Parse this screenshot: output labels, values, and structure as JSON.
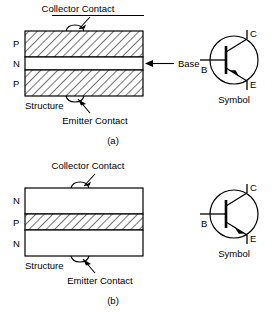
{
  "figure": {
    "title_implicit": "Bipolar junction transistor structures and symbols",
    "colors": {
      "ink": "#000000",
      "background": "#ffffff",
      "hatch": "#000000"
    }
  },
  "panels": [
    {
      "id": "a",
      "caption": "(a)",
      "device_type": "PNP",
      "structure": {
        "label": "Structure",
        "layers": [
          {
            "name": "P",
            "fill": "hatched",
            "role": "collector"
          },
          {
            "name": "N",
            "fill": "white",
            "role": "base"
          },
          {
            "name": "P",
            "fill": "hatched",
            "role": "emitter"
          }
        ],
        "annotations": [
          {
            "name": "collector-contact",
            "text": "Collector Contact",
            "underlined": true,
            "position": "top"
          },
          {
            "name": "emitter-contact",
            "text": "Emitter Contact",
            "underlined": false,
            "position": "bottom"
          },
          {
            "name": "base-callout",
            "text": "Base",
            "position": "right"
          }
        ]
      },
      "symbol": {
        "label": "Symbol",
        "terminals": [
          {
            "name": "base",
            "letter": "B"
          },
          {
            "name": "collector",
            "letter": "C"
          },
          {
            "name": "emitter",
            "letter": "E"
          }
        ],
        "arrow_direction": "in",
        "arrow_on": "emitter"
      }
    },
    {
      "id": "b",
      "caption": "(b)",
      "device_type": "NPN",
      "structure": {
        "label": "Structure",
        "layers": [
          {
            "name": "N",
            "fill": "white",
            "role": "collector"
          },
          {
            "name": "P",
            "fill": "hatched",
            "role": "base"
          },
          {
            "name": "N",
            "fill": "white",
            "role": "emitter"
          }
        ],
        "annotations": [
          {
            "name": "collector-contact",
            "text": "Collector Contact",
            "underlined": false,
            "position": "top"
          },
          {
            "name": "emitter-contact",
            "text": "Emitter Contact",
            "underlined": false,
            "position": "bottom"
          }
        ]
      },
      "symbol": {
        "label": "Symbol",
        "terminals": [
          {
            "name": "base",
            "letter": "B"
          },
          {
            "name": "collector",
            "letter": "C"
          },
          {
            "name": "emitter",
            "letter": "E"
          }
        ],
        "arrow_direction": "out",
        "arrow_on": "emitter"
      }
    }
  ]
}
